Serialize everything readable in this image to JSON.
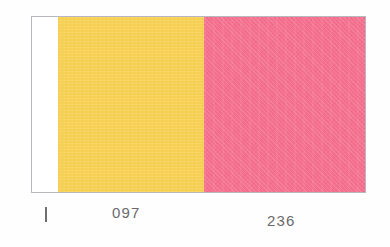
{
  "figure": {
    "type": "color-swatch-strip",
    "background_color": "#fefefe",
    "border_color": "#b9b6bd"
  },
  "swatch": {
    "blank_label": "",
    "bands": [
      {
        "name": "yellow",
        "color": "#f7d155",
        "label": "097"
      },
      {
        "name": "pink",
        "color": "#f4708e",
        "label": "236"
      }
    ]
  },
  "axis": {
    "tick_glyph": "|",
    "tick_label": "",
    "labels": [
      {
        "text": "097",
        "color": "#6a6a6a"
      },
      {
        "text": "236",
        "color": "#6a6a6a"
      }
    ]
  }
}
